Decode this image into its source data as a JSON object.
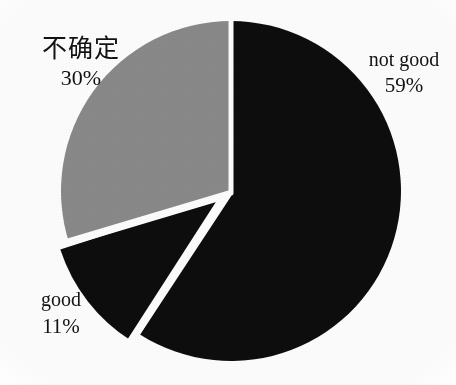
{
  "chart_data": {
    "type": "pie",
    "title": "",
    "subtitle": "",
    "xlabel": "",
    "ylabel": "",
    "legend_position": "none",
    "grid": false,
    "label_format": "name-over-percent",
    "start_angle_deg": 0,
    "direction": "clockwise",
    "categories": [
      "not good",
      "good",
      "不确定"
    ],
    "values": [
      59,
      11,
      30
    ],
    "unit": "%",
    "slices": [
      {
        "name": "not good",
        "value": 59,
        "value_text": "59%",
        "color": "#111111",
        "exploded": false,
        "start_deg": 0,
        "end_deg": 212.4,
        "label_position": "outside-right"
      },
      {
        "name": "good",
        "value": 11,
        "value_text": "11%",
        "color": "#0d0d0d",
        "exploded": true,
        "start_deg": 212.4,
        "end_deg": 252.0,
        "label_position": "outside-left-bottom"
      },
      {
        "name": "不确定",
        "value": 30,
        "value_text": "30%",
        "color": "#8a8a8a",
        "exploded": false,
        "start_deg": 252.0,
        "end_deg": 360.0,
        "label_position": "outside-left-top"
      }
    ],
    "annotations": []
  },
  "labels": {
    "uncertain": {
      "name": "不确定",
      "value": "30%"
    },
    "not_good": {
      "name": "not good",
      "value": "59%"
    },
    "good": {
      "name": "good",
      "value": "11%"
    }
  },
  "style": {
    "background": "#ffffff",
    "separator_color": "#ffffff",
    "text_color": "#121212",
    "gray_slice": "#8a8a8a",
    "black_slice": "#111111"
  },
  "geometry": {
    "center_x": 231,
    "center_y": 191,
    "radius": 170
  }
}
